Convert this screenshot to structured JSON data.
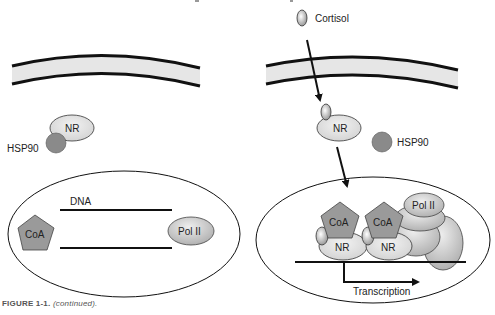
{
  "figure": {
    "caption_label": "FIGURE 1-1.",
    "caption_text": "(continued)."
  },
  "left_panel": {
    "nr_label": "NR",
    "hsp90_label": "HSP90",
    "dna_label": "DNA",
    "coa_label": "CoA",
    "pol2_label": "Pol II"
  },
  "right_panel": {
    "cortisol_label": "Cortisol",
    "nr_label": "NR",
    "hsp90_label": "HSP90",
    "coa1_label": "CoA",
    "coa2_label": "CoA",
    "nr1_label": "NR",
    "nr2_label": "NR",
    "pol2_label": "Pol II",
    "transcription_label": "Transcription"
  },
  "colors": {
    "membrane_fill": "#e6e6e6",
    "hsp90": "#8a8a8a",
    "coa": "#9a9a9a",
    "nr": "#e2e2e2"
  }
}
